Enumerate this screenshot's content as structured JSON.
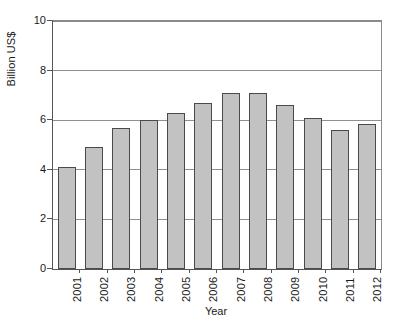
{
  "chart_data": {
    "type": "bar",
    "title": "",
    "xlabel": "Year",
    "ylabel": "Billion US$",
    "categories": [
      "2001",
      "2002",
      "2003",
      "2004",
      "2005",
      "2006",
      "2007",
      "2008",
      "2009",
      "2010",
      "2011",
      "2012"
    ],
    "values": [
      4.1,
      4.9,
      5.7,
      6.0,
      6.3,
      6.7,
      7.1,
      7.1,
      6.6,
      6.1,
      5.6,
      5.85
    ],
    "ylim": [
      0,
      10
    ],
    "yticks": [
      0,
      2,
      4,
      6,
      8,
      10
    ],
    "ytick_labels": [
      "0",
      "2",
      "4",
      "6",
      "8",
      "10"
    ],
    "grid": "horizontal",
    "legend": "none",
    "bar_color": "#c2c2c2",
    "bar_border_color": "#4a4a4a",
    "grid_color": "#8f8f8f",
    "axis_color": "#555555",
    "background": "#ffffff"
  }
}
